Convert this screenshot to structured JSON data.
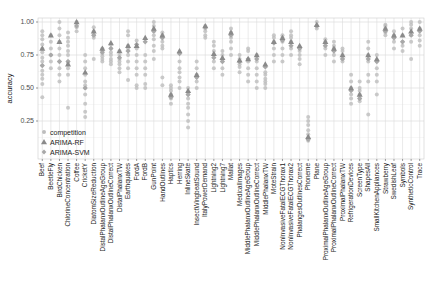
{
  "chart_data": {
    "type": "scatter",
    "title": "",
    "xlabel": "",
    "ylabel": "accuracy",
    "ylim": [
      0.1,
      1.03
    ],
    "yticks": [
      0.25,
      0.5,
      0.75,
      1.0
    ],
    "ytick_labels": [
      "0.25",
      "0.50",
      "0.75",
      "1.00"
    ],
    "grid": true,
    "legend_position": "bottom-left",
    "legend": [
      {
        "name": "competition",
        "marker": "circle"
      },
      {
        "name": "ARIMA-RF",
        "marker": "triangle"
      },
      {
        "name": "ARIMA-SVM",
        "marker": "diamond"
      }
    ],
    "categories": [
      "Beef",
      "BeetleFly",
      "BirdChicken",
      "ChlorineConcentration",
      "Coffee",
      "CricketY",
      "DiatomSizeReduction",
      "DistalPhalanxOutlineAgeGroup",
      "DistalPhalanxOutlineCorrect",
      "DistalPhalanxTW",
      "Earthquakes",
      "FordA",
      "FordB",
      "GunPoint",
      "HandOutlines",
      "Haptics",
      "Herring",
      "InlineSkate",
      "InsectWingbeatSound",
      "ItalyPowerDemand",
      "Lightning2",
      "Lightning7",
      "Mallat",
      "MedicalImages",
      "MiddlePhalanxOutlineAgeGroup",
      "MiddlePhalanxOutlineCorrect",
      "MiddlePhalanxTW",
      "MoteStrain",
      "NonInvasiveFatalECGThorax1",
      "NonInvasiveFatalECGThorax2",
      "PhalangesOutlinesCorrect",
      "Phoneme",
      "Plane",
      "ProximalPhalanxOutlineAgeGroup",
      "ProximalPhalanxOutlineCorrect",
      "ProximalPhalanxTW",
      "RefrigerationDevices",
      "ScreenType",
      "ShapesAll",
      "SmallKitchenAppliances",
      "Strawberry",
      "SwedishLeaf",
      "Symbols",
      "SyntheticControl",
      "Trace"
    ],
    "series": [
      {
        "name": "competition",
        "values": [
          [
            0.43,
            0.53,
            0.57,
            0.6,
            0.63,
            0.67,
            0.7,
            0.73,
            0.77,
            0.8,
            0.83,
            0.87,
            0.9,
            0.93
          ],
          [
            0.65,
            0.7,
            0.75,
            0.8,
            0.85,
            0.9
          ],
          [
            0.55,
            0.6,
            0.65,
            0.7,
            0.75,
            0.8,
            0.85,
            0.9,
            0.95,
            1.0
          ],
          [
            0.35,
            0.6,
            0.65,
            0.68,
            0.7,
            0.75,
            0.78,
            0.82,
            0.85,
            0.88,
            0.92
          ],
          [
            0.93,
            0.96,
            1.0
          ],
          [
            0.28,
            0.32,
            0.38,
            0.45,
            0.5,
            0.52,
            0.55,
            0.6,
            0.65,
            0.7,
            0.75
          ],
          [
            0.72,
            0.88,
            0.9,
            0.93,
            0.96
          ],
          [
            0.7,
            0.72,
            0.74,
            0.76,
            0.78,
            0.8
          ],
          [
            0.68,
            0.7,
            0.72,
            0.75,
            0.77,
            0.8,
            0.83
          ],
          [
            0.62,
            0.65,
            0.68,
            0.7,
            0.72,
            0.75,
            0.78
          ],
          [
            0.56,
            0.65,
            0.7,
            0.75,
            0.8,
            0.82,
            0.9,
            0.93
          ],
          [
            0.5,
            0.52,
            0.6,
            0.65,
            0.7,
            0.75,
            0.8,
            0.86
          ],
          [
            0.5,
            0.53,
            0.6,
            0.65,
            0.7,
            0.75
          ],
          [
            0.72,
            0.78,
            0.82,
            0.87,
            0.9,
            0.93,
            0.97,
            1.0
          ],
          [
            0.52,
            0.58,
            0.8,
            0.82,
            0.85,
            0.88,
            0.9,
            0.92
          ],
          [
            0.38,
            0.42,
            0.45,
            0.48,
            0.5,
            0.52
          ],
          [
            0.5,
            0.55,
            0.58,
            0.62,
            0.65,
            0.7
          ],
          [
            0.2,
            0.25,
            0.3,
            0.35,
            0.38,
            0.42,
            0.45,
            0.5
          ],
          [
            0.5,
            0.55,
            0.6,
            0.65,
            0.7
          ],
          [
            0.88,
            0.9,
            0.93,
            0.95,
            0.97
          ],
          [
            0.65,
            0.7,
            0.75,
            0.78,
            0.82,
            0.85
          ],
          [
            0.6,
            0.65,
            0.7,
            0.72,
            0.75,
            0.78
          ],
          [
            0.75,
            0.8,
            0.85,
            0.88,
            0.92,
            0.95
          ],
          [
            0.62,
            0.66,
            0.68,
            0.7,
            0.72,
            0.75
          ],
          [
            0.55,
            0.6,
            0.65,
            0.7,
            0.78,
            0.8
          ],
          [
            0.5,
            0.55,
            0.6,
            0.65,
            0.7,
            0.75
          ],
          [
            0.5,
            0.53,
            0.55,
            0.57,
            0.6,
            0.62
          ],
          [
            0.7,
            0.75,
            0.8,
            0.85,
            0.88,
            0.9
          ],
          [
            0.7,
            0.75,
            0.8,
            0.85,
            0.88,
            0.9
          ],
          [
            0.75,
            0.8,
            0.85,
            0.88,
            0.9,
            0.93
          ],
          [
            0.68,
            0.72,
            0.75,
            0.78,
            0.8
          ],
          [
            0.1,
            0.15,
            0.18,
            0.22,
            0.25,
            0.28
          ],
          [
            0.95,
            0.97,
            1.0
          ],
          [
            0.75,
            0.8,
            0.82,
            0.85,
            0.87
          ],
          [
            0.7,
            0.75,
            0.8,
            0.82,
            0.85
          ],
          [
            0.7,
            0.72,
            0.75,
            0.78,
            0.8
          ],
          [
            0.38,
            0.42,
            0.45,
            0.5,
            0.55,
            0.6
          ],
          [
            0.4,
            0.42,
            0.45,
            0.48,
            0.5,
            0.55
          ],
          [
            0.3,
            0.55,
            0.6,
            0.7,
            0.75,
            0.8,
            0.85
          ],
          [
            0.45,
            0.55,
            0.6,
            0.65,
            0.7,
            0.75
          ],
          [
            0.9,
            0.92,
            0.95,
            0.97,
            0.98
          ],
          [
            0.8,
            0.85,
            0.88,
            0.9,
            0.93
          ],
          [
            0.78,
            0.82,
            0.85,
            0.9,
            0.95
          ],
          [
            0.72,
            0.85,
            0.9,
            0.95,
            0.98,
            1.0
          ],
          [
            0.82,
            0.86,
            0.9,
            0.95,
            1.0
          ]
        ]
      },
      {
        "name": "ARIMA-RF",
        "values": [
          0.8,
          0.9,
          0.85,
          0.68,
          1.0,
          0.62,
          0.93,
          0.8,
          0.84,
          0.78,
          0.82,
          0.82,
          0.88,
          0.95,
          0.9,
          0.45,
          0.78,
          0.48,
          0.6,
          0.97,
          0.76,
          0.73,
          0.92,
          0.71,
          0.72,
          0.75,
          0.68,
          0.85,
          0.88,
          0.85,
          0.82,
          0.13,
          0.98,
          0.85,
          0.8,
          0.75,
          0.5,
          0.45,
          0.75,
          0.72,
          0.95,
          0.9,
          0.9,
          0.93,
          0.95
        ]
      },
      {
        "name": "ARIMA-SVM",
        "values": [
          0.67,
          0.75,
          0.7,
          0.7,
          0.97,
          0.5,
          0.9,
          0.77,
          0.8,
          0.73,
          0.78,
          0.83,
          0.85,
          0.93,
          0.88,
          0.43,
          0.76,
          0.45,
          0.58,
          0.96,
          0.73,
          0.7,
          0.9,
          0.7,
          0.72,
          0.72,
          0.66,
          0.84,
          0.86,
          0.82,
          0.8,
          0.11,
          0.97,
          0.82,
          0.78,
          0.72,
          0.48,
          0.42,
          0.72,
          0.7,
          0.93,
          0.88,
          0.85,
          0.9,
          0.93
        ]
      }
    ]
  }
}
